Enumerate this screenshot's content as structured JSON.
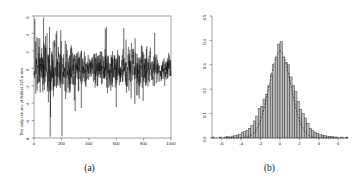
{
  "figure": {
    "panels": [
      {
        "caption": "(a)",
        "type": "line"
      },
      {
        "caption": "(b)",
        "type": "histogram"
      }
    ]
  },
  "chart_data": [
    {
      "type": "line",
      "title": "",
      "subtitle": "",
      "xlabel": "",
      "ylabel": "The daily returns of Nikkei 225 index",
      "xlim": [
        0,
        1000
      ],
      "ylim": [
        -8,
        6
      ],
      "xticks": [
        "0",
        "200",
        "400",
        "600",
        "800",
        "1000"
      ],
      "xtickvals": [
        0,
        200,
        400,
        600,
        800,
        1000
      ],
      "yticks": [
        "-8",
        "-6",
        "-4",
        "-2",
        "0",
        "2",
        "4",
        "6"
      ],
      "ytickvals": [
        -8,
        -6,
        -4,
        -2,
        0,
        2,
        4,
        6
      ],
      "grid": false,
      "frame": "box",
      "legend": "none",
      "line_color": "#000000",
      "n": 1000,
      "description": "Daily log-returns series showing volatility clustering; high volatility in first ~300 observations, a deep negative spike near t=120 reaching about -8, and gradually calmer amplitude after t=900.",
      "x": [
        0,
        10,
        20,
        30,
        40,
        50,
        60,
        70,
        80,
        90,
        100,
        110,
        120,
        130,
        140,
        150,
        160,
        170,
        180,
        190,
        200,
        210,
        220,
        230,
        240,
        250,
        260,
        270,
        280,
        290,
        300,
        310,
        320,
        330,
        340,
        350,
        360,
        370,
        380,
        390,
        400,
        410,
        420,
        430,
        440,
        450,
        460,
        470,
        480,
        490,
        500,
        510,
        520,
        530,
        540,
        550,
        560,
        570,
        580,
        590,
        600,
        610,
        620,
        630,
        640,
        650,
        660,
        670,
        680,
        690,
        700,
        710,
        720,
        730,
        740,
        750,
        760,
        770,
        780,
        790,
        800,
        810,
        820,
        830,
        840,
        850,
        860,
        870,
        880,
        890,
        900,
        910,
        920,
        930,
        940,
        950,
        960,
        970,
        980,
        990
      ],
      "y": [
        0.3,
        5.6,
        -2.1,
        3.4,
        -3.8,
        1.2,
        -4.6,
        2.7,
        -1.4,
        3.1,
        -2.6,
        1.9,
        -7.9,
        2.2,
        -3.3,
        1.5,
        -2.0,
        2.9,
        -1.1,
        0.8,
        -4.2,
        3.6,
        -2.4,
        1.7,
        -3.0,
        2.3,
        -1.6,
        1.0,
        -2.8,
        3.2,
        -1.9,
        2.6,
        -3.4,
        1.3,
        -2.2,
        2.0,
        -1.5,
        2.8,
        -3.6,
        1.1,
        -2.5,
        1.8,
        -1.3,
        2.4,
        -3.1,
        1.6,
        -2.7,
        2.1,
        -1.2,
        1.4,
        -2.3,
        4.1,
        -3.7,
        2.5,
        -1.8,
        3.9,
        -2.9,
        1.9,
        -3.2,
        2.2,
        -1.7,
        2.6,
        -4.4,
        3.3,
        -2.1,
        4.6,
        -3.0,
        1.5,
        -2.4,
        2.8,
        -1.6,
        2.0,
        -3.5,
        1.2,
        -2.2,
        1.7,
        -1.4,
        2.3,
        -2.6,
        1.0,
        -1.9,
        2.1,
        -1.3,
        1.6,
        -2.0,
        3.8,
        -1.8,
        1.4,
        -2.5,
        4.0,
        -1.5,
        1.1,
        -1.7,
        1.3,
        -0.9,
        1.5,
        -1.2,
        0.8,
        -1.4,
        1.0
      ]
    },
    {
      "type": "histogram",
      "title": "",
      "subtitle": "",
      "xlabel": "",
      "ylabel": "Density",
      "xlim": [
        -7,
        7
      ],
      "ylim": [
        0.0,
        0.5
      ],
      "xticks": [
        "-6",
        "-4",
        "-2",
        "0",
        "2",
        "4",
        "6"
      ],
      "xtickvals": [
        -6,
        -4,
        -2,
        0,
        2,
        4,
        6
      ],
      "yticks": [
        "0.0",
        "0.1",
        "0.2",
        "0.3",
        "0.4",
        "0.5"
      ],
      "ytickvals": [
        0.0,
        0.1,
        0.2,
        0.3,
        0.4,
        0.5
      ],
      "grid": false,
      "frame": "L-shaped",
      "legend": "none",
      "bar_fill": "#b8b8b8",
      "bar_stroke": "#1a1a1a",
      "overlay": {
        "name": "normal density",
        "style": "dashed",
        "color": "#1a1a1a",
        "mean": 0.0,
        "sd": 1.12
      },
      "bin_width": 0.25,
      "bin_centers": [
        -6.875,
        -6.625,
        -6.375,
        -6.125,
        -5.875,
        -5.625,
        -5.375,
        -5.125,
        -4.875,
        -4.625,
        -4.375,
        -4.125,
        -3.875,
        -3.625,
        -3.375,
        -3.125,
        -2.875,
        -2.625,
        -2.375,
        -2.125,
        -1.875,
        -1.625,
        -1.375,
        -1.125,
        -0.875,
        -0.625,
        -0.375,
        -0.125,
        0.125,
        0.375,
        0.625,
        0.875,
        1.125,
        1.375,
        1.625,
        1.875,
        2.125,
        2.375,
        2.625,
        2.875,
        3.125,
        3.375,
        3.625,
        3.875,
        4.125,
        4.375,
        4.625,
        4.875,
        5.125,
        5.375,
        5.625,
        5.875,
        6.125,
        6.375,
        6.625,
        6.875
      ],
      "densities": [
        0.004,
        0.0,
        0.0,
        0.004,
        0.0,
        0.004,
        0.006,
        0.004,
        0.008,
        0.01,
        0.012,
        0.016,
        0.022,
        0.026,
        0.032,
        0.04,
        0.052,
        0.07,
        0.09,
        0.122,
        0.13,
        0.16,
        0.178,
        0.215,
        0.26,
        0.3,
        0.33,
        0.385,
        0.395,
        0.33,
        0.31,
        0.3,
        0.25,
        0.215,
        0.19,
        0.15,
        0.118,
        0.1,
        0.082,
        0.06,
        0.04,
        0.03,
        0.024,
        0.018,
        0.014,
        0.012,
        0.01,
        0.008,
        0.006,
        0.006,
        0.004,
        0.004,
        0.0,
        0.004,
        0.0,
        0.004
      ]
    }
  ]
}
